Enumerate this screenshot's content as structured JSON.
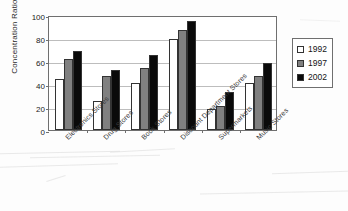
{
  "chart_data": {
    "type": "bar",
    "title": "",
    "subtitle": "",
    "xlabel": "",
    "ylabel": "Concentration Ratio",
    "ylim": [
      0,
      100
    ],
    "ytick_labels": [
      "0",
      "20",
      "40",
      "60",
      "80",
      "100"
    ],
    "ytick_values": [
      0,
      20,
      40,
      60,
      80,
      100
    ],
    "grid": true,
    "legend_position": "right",
    "categories": [
      "Electronics Stores",
      "Drug Stores",
      "Book Stores",
      "Discount Department Stores",
      "Supermarkets",
      "Music Stores"
    ],
    "series": [
      {
        "name": "1992",
        "color": "#ffffff",
        "values": [
          44,
          25,
          41,
          79,
          18,
          41
        ]
      },
      {
        "name": "1997",
        "color": "#808080",
        "values": [
          62,
          47,
          54,
          87,
          21,
          47
        ]
      },
      {
        "name": "2002",
        "color": "#0a0a0a",
        "values": [
          69,
          52,
          65,
          95,
          33,
          58
        ]
      }
    ]
  },
  "legend": {
    "entries": [
      {
        "label": "1992",
        "swatch": "white-square-swatch"
      },
      {
        "label": "1997",
        "swatch": "gray-square-swatch"
      },
      {
        "label": "2002",
        "swatch": "black-square-swatch"
      }
    ]
  }
}
